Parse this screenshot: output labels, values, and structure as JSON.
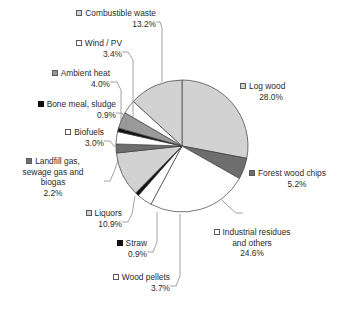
{
  "chart_data": {
    "type": "pie",
    "title": "",
    "legend_position": "callout-labels",
    "total_percent": 100.0,
    "start_angle_deg": 0,
    "direction": "clockwise",
    "categories": [
      "Log wood",
      "Forest wood chips",
      "Industrial residues and others",
      "Wood pellets",
      "Straw",
      "Liquors",
      "Landfill gas, sewage gas and biogas",
      "Biofuels",
      "Bone meal, sludge",
      "Ambient heat",
      "Wind / PV",
      "Combustible waste"
    ],
    "values": [
      28.0,
      5.2,
      24.6,
      3.7,
      0.9,
      10.9,
      2.2,
      3.0,
      0.9,
      4.0,
      3.4,
      13.2
    ],
    "value_labels": [
      "28.0%",
      "5.2%",
      "24.6%",
      "3.7%",
      "0.9%",
      "10.9%",
      "2.2%",
      "3.0%",
      "0.9%",
      "4.0%",
      "3.4%",
      "13.2%"
    ],
    "colors": [
      "#d2d2d2",
      "#6e6e6e",
      "#ffffff",
      "#ffffff",
      "#101010",
      "#d2d2d2",
      "#6e6e6e",
      "#ffffff",
      "#101010",
      "#9a9a9a",
      "#ffffff",
      "#d2d2d2"
    ],
    "xlabel": "",
    "ylabel": ""
  },
  "slices": [
    {
      "name": "Log wood",
      "percent_label": "28.0%",
      "swatch": "lightgray",
      "label_lines": [
        "Log wood"
      ]
    },
    {
      "name": "Forest wood chips",
      "percent_label": "5.2%",
      "swatch": "darkgray",
      "label_lines": [
        "Forest wood chips"
      ]
    },
    {
      "name": "Industrial residues and others",
      "percent_label": "24.6%",
      "swatch": "white",
      "label_lines": [
        "Industrial residues",
        "and others"
      ]
    },
    {
      "name": "Wood pellets",
      "percent_label": "3.7%",
      "swatch": "white",
      "label_lines": [
        "Wood pellets"
      ]
    },
    {
      "name": "Straw",
      "percent_label": "0.9%",
      "swatch": "black",
      "label_lines": [
        "Straw"
      ]
    },
    {
      "name": "Liquors",
      "percent_label": "10.9%",
      "swatch": "lightgray",
      "label_lines": [
        "Liquors"
      ]
    },
    {
      "name": "Landfill gas, sewage gas and biogas",
      "percent_label": "2.2%",
      "swatch": "darkgray",
      "label_lines": [
        "Landfill gas,",
        "sewage gas and",
        "biogas"
      ]
    },
    {
      "name": "Biofuels",
      "percent_label": "3.0%",
      "swatch": "white",
      "label_lines": [
        "Biofuels"
      ]
    },
    {
      "name": "Bone meal, sludge",
      "percent_label": "0.9%",
      "swatch": "black",
      "label_lines": [
        "Bone meal, sludge"
      ]
    },
    {
      "name": "Ambient heat",
      "percent_label": "4.0%",
      "swatch": "medgray",
      "label_lines": [
        "Ambient heat"
      ]
    },
    {
      "name": "Wind / PV",
      "percent_label": "3.4%",
      "swatch": "white",
      "label_lines": [
        "Wind / PV"
      ]
    },
    {
      "name": "Combustible waste",
      "percent_label": "13.2%",
      "swatch": "lightgray",
      "label_lines": [
        "Combustible waste"
      ]
    }
  ]
}
